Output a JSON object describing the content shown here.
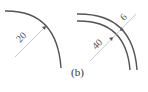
{
  "figure": {
    "caption": "(b)",
    "left_diagram": {
      "description": "single curved line with radius dimension",
      "radius_label": "20"
    },
    "right_diagram": {
      "description": "double curved lines with radius and width dimensions",
      "radius_label": "40",
      "width_label": "6"
    },
    "colors": {
      "stroke": "#555555",
      "dimension_line": "#bbbbbb",
      "text": "#555555"
    }
  }
}
